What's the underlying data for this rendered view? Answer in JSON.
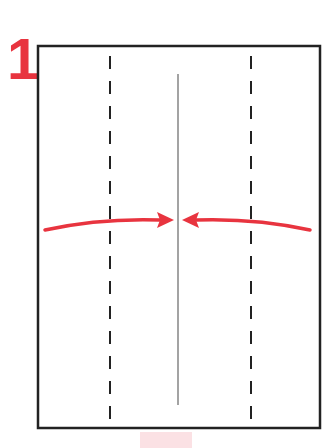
{
  "step": {
    "number": "1"
  },
  "diagram": {
    "paper": {
      "x": 38,
      "y": 46,
      "width": 282,
      "height": 382,
      "stroke": "#222222"
    },
    "center_line": {
      "x": 178,
      "y1": 74,
      "y2": 405,
      "color": "#555555"
    },
    "fold_lines": [
      {
        "x": 110,
        "style": "dashed"
      },
      {
        "x": 251,
        "style": "dashed"
      }
    ],
    "arrows": [
      {
        "direction": "right",
        "from_x": 45,
        "to_x": 172,
        "y": 220
      },
      {
        "direction": "left",
        "from_x": 310,
        "to_x": 183,
        "y": 220
      }
    ],
    "accent_color": "#e8343f"
  }
}
